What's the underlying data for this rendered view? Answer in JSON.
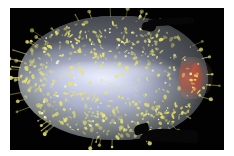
{
  "figure": {
    "canvas_background": "#020202",
    "page_background": "#ffffff",
    "width": 234,
    "height": 156
  },
  "render": {
    "view_label": "lateral view",
    "canvas": {
      "left": 10,
      "top": 8,
      "width": 214,
      "height": 142
    }
  },
  "specimen": {
    "name": "ovoid-specimen",
    "shape": "prolate ellipsoid, rounded at left pole, tapered to a point at right pole",
    "body_color": "#c4c9e2",
    "rim_color": "#96986e",
    "highlight_color": "#eef2ff",
    "shadow_color": "#282c34",
    "bounds": {
      "left": 18,
      "top": 16,
      "width": 190,
      "height": 124
    }
  },
  "features": [
    {
      "name": "granule-speckles",
      "label": "yellow fluorescent granules",
      "color": "#e8e46a",
      "count": 520,
      "distribution": "dense across surface, heaviest near the silhouette rim"
    },
    {
      "name": "apex-patch",
      "label": "red apical signal patch",
      "color": "#b05a4a",
      "position": "right pole"
    },
    {
      "name": "equatorial-highlight",
      "label": "specular band",
      "color": "#eef2ff",
      "position": "central horizontal band"
    },
    {
      "name": "radiating-spikes",
      "label": "radiating filament spikes",
      "color": "#ded96a",
      "count": 46,
      "position": "projecting outward from silhouette edge"
    },
    {
      "name": "appendage-top",
      "label": "dark dorsal appendage silhouette",
      "color": "#070707",
      "position": "upper right"
    },
    {
      "name": "appendage-bottom",
      "label": "dark ventral appendage silhouette",
      "color": "#070707",
      "position": "lower right"
    }
  ],
  "palette": {
    "background": "#020202",
    "body": "#c4c9e2",
    "granule": "#e8e46a",
    "apex": "#b05a4a",
    "highlight": "#eef2ff",
    "appendage": "#070707"
  }
}
